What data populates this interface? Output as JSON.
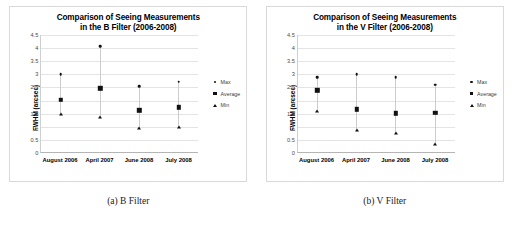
{
  "figure": {
    "panels": [
      {
        "caption": "(a) B Filter",
        "chart_data": {
          "type": "scatter",
          "title": "Comparison of Seeing Measurements in the B Filter (2006-2008)",
          "title_line1": "Comparison of Seeing Measurements",
          "title_line2": "in the B Filter (2006-2008)",
          "xlabel": "",
          "ylabel": "FWHM (arcsec)",
          "ylim": [
            0,
            4.5
          ],
          "yticks": [
            "0",
            "0.5",
            "1",
            "1.5",
            "2",
            "2.5",
            "3",
            "3.5",
            "4",
            "4.5"
          ],
          "ytick_values": [
            0,
            0.5,
            1,
            1.5,
            2,
            2.5,
            3,
            3.5,
            4,
            4.5
          ],
          "grid": true,
          "legend_position": "right",
          "categories": [
            "August 2006",
            "April 2007",
            "June 2008",
            "July 2008"
          ],
          "series": [
            {
              "name": "Max",
              "marker": "circle",
              "values": [
                3.01,
                4.08,
                2.55,
                2.72
              ]
            },
            {
              "name": "Average",
              "marker": "square",
              "values": [
                2.02,
                2.47,
                1.63,
                1.74
              ]
            },
            {
              "name": "Min",
              "marker": "triangle",
              "values": [
                1.48,
                1.38,
                0.94,
                1.0
              ]
            }
          ]
        }
      },
      {
        "caption": "(b) V Filter",
        "chart_data": {
          "type": "scatter",
          "title": "Comparison of Seeing Measurements in the V Filter (2006-2008)",
          "title_line1": "Comparison of Seeing Measurements",
          "title_line2": "in the V Filter (2006-2008)",
          "xlabel": "",
          "ylabel": "FWHM (arcsec)",
          "ylim": [
            0,
            4.5
          ],
          "yticks": [
            "0",
            "0.5",
            "1",
            "1.5",
            "2",
            "2.5",
            "3",
            "3.5",
            "4",
            "4.5"
          ],
          "ytick_values": [
            0,
            0.5,
            1,
            1.5,
            2,
            2.5,
            3,
            3.5,
            4,
            4.5
          ],
          "grid": true,
          "legend_position": "right",
          "categories": [
            "August 2006",
            "April 2007",
            "June 2008",
            "July 2008"
          ],
          "series": [
            {
              "name": "Max",
              "marker": "circle",
              "values": [
                2.89,
                3.0,
                2.88,
                2.6
              ]
            },
            {
              "name": "Average",
              "marker": "square",
              "values": [
                2.39,
                1.67,
                1.51,
                1.54
              ]
            },
            {
              "name": "Min",
              "marker": "triangle",
              "values": [
                1.59,
                0.89,
                0.76,
                0.35
              ]
            }
          ]
        }
      }
    ]
  }
}
